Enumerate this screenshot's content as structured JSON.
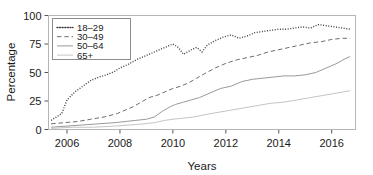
{
  "chart_data": {
    "type": "line",
    "title": "",
    "xlabel": "Years",
    "ylabel": "Percentage",
    "xlim": [
      2005.3,
      2016.9
    ],
    "ylim": [
      0,
      100
    ],
    "xticks": [
      2006,
      2008,
      2010,
      2012,
      2014,
      2016
    ],
    "xtick_labels": [
      "2006",
      "2008",
      "2010",
      "2012",
      "2014",
      "2016"
    ],
    "yticks": [
      0,
      25,
      50,
      75,
      100
    ],
    "ytick_labels": [
      "0",
      "25",
      "50",
      "75",
      "100"
    ],
    "grid": false,
    "legend_position": "upper left",
    "series": [
      {
        "name": "18-29",
        "label": "18–29",
        "style": "dotted",
        "color": "#3f3f3f",
        "x": [
          2005.4,
          2005.8,
          2006.0,
          2006.3,
          2006.6,
          2006.9,
          2007.2,
          2007.5,
          2007.8,
          2008.0,
          2008.3,
          2008.6,
          2008.9,
          2009.2,
          2009.5,
          2009.8,
          2010.0,
          2010.2,
          2010.4,
          2010.7,
          2010.9,
          2011.1,
          2011.3,
          2011.6,
          2011.9,
          2012.2,
          2012.5,
          2012.8,
          2013.1,
          2013.4,
          2013.7,
          2014.0,
          2014.3,
          2014.6,
          2014.9,
          2015.2,
          2015.5,
          2015.8,
          2016.1,
          2016.4,
          2016.7
        ],
        "y": [
          8,
          14,
          26,
          33,
          38,
          43,
          46,
          48,
          51,
          54,
          57,
          61,
          64,
          67,
          70,
          73,
          75,
          72,
          66,
          70,
          72,
          68,
          74,
          78,
          81,
          83,
          80,
          82,
          85,
          86,
          87,
          88,
          88,
          89,
          90,
          89,
          92,
          91,
          90,
          89,
          88
        ]
      },
      {
        "name": "30-49",
        "label": "30–49",
        "style": "dashed",
        "color": "#6e6e6e",
        "x": [
          2005.4,
          2005.9,
          2006.4,
          2006.9,
          2007.4,
          2007.9,
          2008.2,
          2008.5,
          2008.8,
          2009.1,
          2009.4,
          2009.7,
          2010.0,
          2010.3,
          2010.6,
          2010.9,
          2011.2,
          2011.6,
          2012.0,
          2012.4,
          2012.8,
          2013.2,
          2013.6,
          2014.0,
          2014.4,
          2014.8,
          2015.2,
          2015.6,
          2016.0,
          2016.4,
          2016.7
        ],
        "y": [
          5,
          6,
          7,
          9,
          11,
          14,
          17,
          20,
          24,
          28,
          30,
          33,
          36,
          38,
          41,
          45,
          49,
          54,
          58,
          61,
          63,
          65,
          68,
          70,
          72,
          74,
          76,
          77,
          79,
          80,
          80
        ]
      },
      {
        "name": "50-64",
        "label": "50–64",
        "style": "solid",
        "color": "#9a9a9a",
        "x": [
          2005.4,
          2006.0,
          2006.6,
          2007.2,
          2007.8,
          2008.2,
          2008.6,
          2009.0,
          2009.3,
          2009.6,
          2009.9,
          2010.1,
          2010.4,
          2010.7,
          2011.0,
          2011.4,
          2011.8,
          2012.2,
          2012.6,
          2013.0,
          2013.4,
          2013.8,
          2014.2,
          2014.6,
          2015.0,
          2015.4,
          2015.8,
          2016.2,
          2016.5,
          2016.7
        ],
        "y": [
          2,
          3,
          4,
          5,
          6,
          7,
          8,
          9,
          11,
          16,
          20,
          22,
          24,
          26,
          28,
          32,
          36,
          38,
          42,
          44,
          45,
          46,
          47,
          47,
          48,
          50,
          54,
          58,
          62,
          64
        ]
      },
      {
        "name": "65+",
        "label": "65+",
        "style": "solid",
        "color": "#c4c4c4",
        "x": [
          2005.4,
          2006.2,
          2007.0,
          2007.8,
          2008.4,
          2008.9,
          2009.3,
          2009.7,
          2010.0,
          2010.4,
          2010.8,
          2011.2,
          2011.7,
          2012.2,
          2012.7,
          2013.2,
          2013.7,
          2014.2,
          2014.7,
          2015.2,
          2015.7,
          2016.2,
          2016.7
        ],
        "y": [
          1,
          2,
          2,
          3,
          4,
          5,
          6,
          8,
          9,
          10,
          11,
          13,
          15,
          17,
          19,
          21,
          23,
          24,
          26,
          28,
          30,
          32,
          34
        ]
      }
    ]
  }
}
